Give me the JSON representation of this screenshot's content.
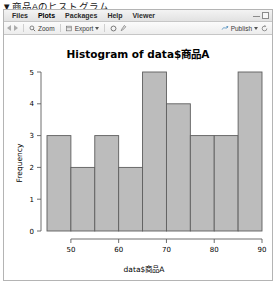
{
  "caption": "▼商品Aのヒストグラム",
  "window": {
    "menu_items": [
      {
        "label": "Files",
        "active": false
      },
      {
        "label": "Plots",
        "active": true
      },
      {
        "label": "Packages",
        "active": false
      },
      {
        "label": "Help",
        "active": false
      },
      {
        "label": "Viewer",
        "active": false
      }
    ],
    "controls": {
      "minimize": "minimize-icon",
      "maximize": "maximize-icon"
    }
  },
  "toolbar": {
    "back": "back-arrow-icon",
    "forward": "forward-arrow-icon",
    "zoom_label": "Zoom",
    "zoom_icon": "magnifier-icon",
    "export_label": "Export",
    "export_icon": "export-icon",
    "export_caret": "chevron-down-icon",
    "remove_icon": "remove-plot-icon",
    "clear_icon": "clear-all-plots-icon",
    "publish_label": "Publish",
    "publish_icon": "publish-icon",
    "publish_caret": "chevron-down-icon",
    "refresh_icon": "refresh-icon"
  },
  "chart_data": {
    "type": "bar",
    "title": "Histogram of data$商品A",
    "xlabel": "data$商品A",
    "ylabel": "Frequency",
    "categories": [
      "45-50",
      "50-55",
      "55-60",
      "60-65",
      "65-70",
      "70-75",
      "75-80",
      "80-85",
      "85-90"
    ],
    "bin_edges": [
      45,
      50,
      55,
      60,
      65,
      70,
      75,
      80,
      85,
      90
    ],
    "values": [
      3,
      2,
      3,
      2,
      5,
      4,
      3,
      3,
      5
    ],
    "xlim": [
      45,
      90
    ],
    "ylim": [
      0,
      5
    ],
    "xticks": [
      50,
      60,
      70,
      80,
      90
    ],
    "yticks": [
      0,
      1,
      2,
      3,
      4,
      5
    ],
    "grid": false,
    "legend": null,
    "bar_color": "#bcbcbc",
    "bar_edge_color": "#5e5e5e"
  }
}
